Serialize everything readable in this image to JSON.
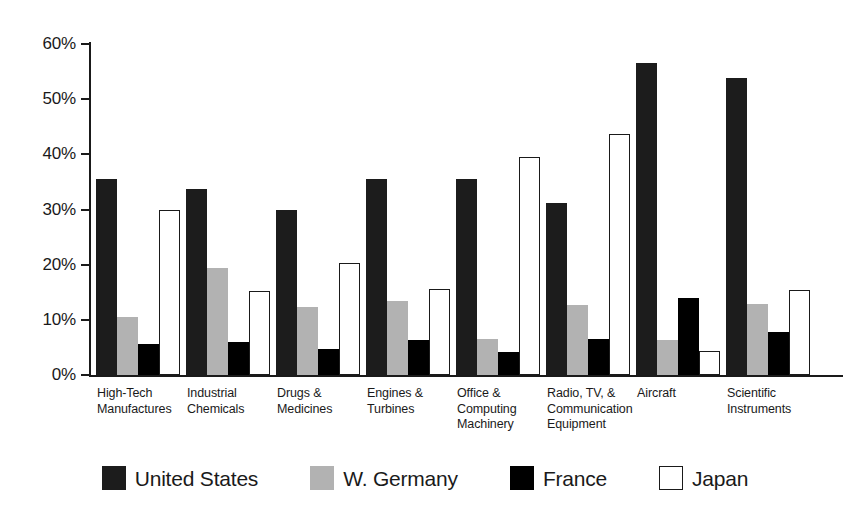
{
  "chart_data": {
    "type": "bar",
    "title": "",
    "xlabel": "",
    "ylabel": "",
    "ylim": [
      0,
      60
    ],
    "grid": false,
    "legend_position": "bottom",
    "ytick_labels": [
      "0%",
      "10%",
      "20%",
      "30%",
      "40%",
      "50%",
      "60%"
    ],
    "ytick_values": [
      0,
      10,
      20,
      30,
      40,
      50,
      60
    ],
    "categories": [
      "High-Tech Manufactures",
      "Industrial Chemicals",
      "Drugs & Medicines",
      "Engines & Turbines",
      "Office & Computing Machinery",
      "Radio, TV, & Communication Equipment",
      "Aircraft",
      "Scientific Instruments"
    ],
    "category_lines": [
      [
        "High-Tech",
        "Manufactures"
      ],
      [
        "Industrial",
        "Chemicals"
      ],
      [
        "Drugs &",
        "Medicines"
      ],
      [
        "Engines &",
        "Turbines"
      ],
      [
        "Office &",
        "Computing",
        "Machinery"
      ],
      [
        "Radio, TV, &",
        "Communication",
        "Equipment"
      ],
      [
        "Aircraft"
      ],
      [
        "Scientific",
        "Instruments"
      ]
    ],
    "series": [
      {
        "name": "United States",
        "color": "#1c1c1c",
        "values": [
          35.5,
          33.7,
          30.0,
          35.6,
          35.6,
          31.2,
          56.5,
          53.9
        ]
      },
      {
        "name": "W. Germany",
        "color": "#b2b2b2",
        "values": [
          10.6,
          19.4,
          12.3,
          13.4,
          6.5,
          12.7,
          6.3,
          12.8
        ]
      },
      {
        "name": "France",
        "color": "#000000",
        "values": [
          5.7,
          5.9,
          4.8,
          6.3,
          4.1,
          6.6,
          14.0,
          7.8
        ]
      },
      {
        "name": "Japan",
        "color": "#ffffff",
        "values": [
          30.0,
          15.3,
          20.3,
          15.6,
          39.6,
          43.7,
          4.3,
          15.5
        ]
      }
    ]
  },
  "legend": {
    "items": [
      {
        "label": "United States",
        "key": "us"
      },
      {
        "label": "W. Germany",
        "key": "wg"
      },
      {
        "label": "France",
        "key": "fr"
      },
      {
        "label": "Japan",
        "key": "jp"
      }
    ]
  }
}
